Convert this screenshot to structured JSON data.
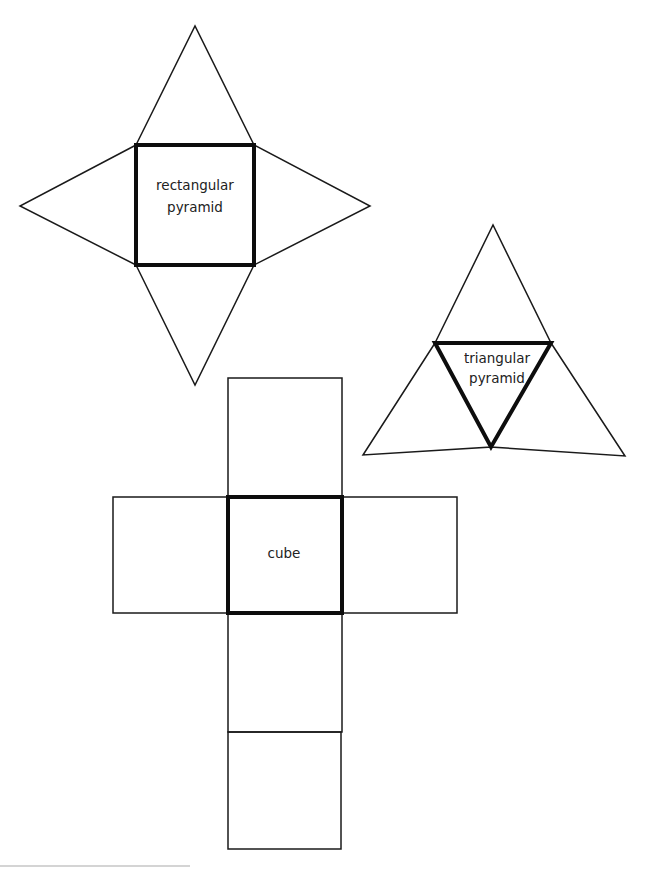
{
  "figure": {
    "nets": [
      {
        "id": "rectangular-pyramid",
        "label_lines": [
          "rectangular",
          "pyramid"
        ],
        "base_shape": "square",
        "faces": 5
      },
      {
        "id": "triangular-pyramid",
        "label_lines": [
          "triangular",
          "pyramid"
        ],
        "base_shape": "triangle",
        "faces": 4
      },
      {
        "id": "cube",
        "label_lines": [
          "cube"
        ],
        "base_shape": "square",
        "faces": 6
      }
    ],
    "colors": {
      "stroke": "#1a1a1a",
      "base_stroke": "#0d0d0d",
      "text": "#222222",
      "background": "#ffffff",
      "footer_line": "#d4d4d4"
    }
  }
}
